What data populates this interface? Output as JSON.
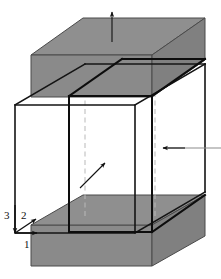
{
  "figure": {
    "background": "#ffffff"
  },
  "colors": {
    "platen_fill": "#8a8a8a",
    "platen_edge": "#4a4a4a",
    "wire_edge": "#1a1a1a",
    "inner_edge": "#141414",
    "hidden_edge": "#b9b9b9",
    "arrow": "#111111",
    "leader_line": "#8c8c8c"
  },
  "axes": {
    "origin_label": "",
    "items": [
      {
        "id": "axis-1",
        "label": "1",
        "direction": "right",
        "x": 27,
        "y": 243
      },
      {
        "id": "axis-2",
        "label": "2",
        "direction": "up-right",
        "x": 24,
        "y": 216
      },
      {
        "id": "axis-3",
        "label": "3",
        "direction": "down",
        "x": 7,
        "y": 216
      }
    ]
  },
  "arrows": [
    {
      "id": "top-load-arrow",
      "label": "",
      "direction": "up",
      "x": 112,
      "y": 14
    },
    {
      "id": "right-load-arrow",
      "label": "",
      "direction": "left",
      "x": 180,
      "y": 148
    },
    {
      "id": "center-load-arrow",
      "label": "",
      "direction": "up-right",
      "x": 96,
      "y": 168
    }
  ],
  "parts": [
    {
      "id": "top-platen",
      "label": "top platen",
      "shading": "gray"
    },
    {
      "id": "bottom-platen",
      "label": "bottom platen",
      "shading": "gray"
    },
    {
      "id": "outer-cube",
      "label": "outer wireframe cube",
      "shading": "none"
    },
    {
      "id": "inner-cube",
      "label": "inner cube outline",
      "shading": "none"
    }
  ]
}
